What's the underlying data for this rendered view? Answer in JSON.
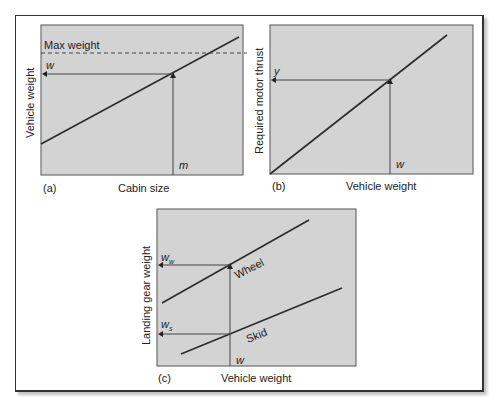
{
  "figure": {
    "panels": [
      {
        "id": "a",
        "tag": "(a)",
        "xlabel": "Cabin size",
        "ylabel": "Vehicle weight",
        "annotations": {
          "max_line_label": "Max weight",
          "y_marker": "w",
          "x_marker": "m"
        }
      },
      {
        "id": "b",
        "tag": "(b)",
        "xlabel": "Vehicle weight",
        "ylabel": "Required motor thrust",
        "annotations": {
          "y_marker": "y",
          "x_marker": "w"
        }
      },
      {
        "id": "c",
        "tag": "(c)",
        "xlabel": "Vehicle weight",
        "ylabel": "Landing gear weight",
        "annotations": {
          "wheel_label": "Wheel",
          "skid_label": "Skid",
          "wheel_marker_base": "w",
          "wheel_marker_sub": "w",
          "skid_marker_base": "w",
          "skid_marker_sub": "s",
          "x_marker": "w"
        }
      }
    ]
  },
  "colors": {
    "plot_fill": "#d3d3d3",
    "line": "#2b2b2b",
    "frame": "#333333"
  }
}
